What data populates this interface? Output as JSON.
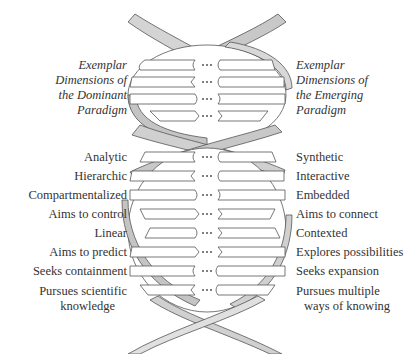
{
  "figure": {
    "title_cut": "",
    "dominant_header": [
      "Exemplar",
      "Dimensions of",
      "the Dominant",
      "Paradigm"
    ],
    "emerging_header": [
      "Exemplar",
      "Dimensions of",
      "the Emerging",
      "Paradigm"
    ],
    "rung_connector": "•••",
    "dominant_items": [
      "Analytic",
      "Hierarchic",
      "Compartmentalized",
      "Aims to control",
      "Linear",
      "Aims to predict",
      "Seeks containment",
      [
        "Pursues scientific",
        "knowledge"
      ]
    ],
    "emerging_items": [
      "Synthetic",
      "Interactive",
      "Embedded",
      "Aims to connect",
      "Contexted",
      "Explores possibilities",
      "Seeks expansion",
      [
        "Pursues multiple",
        "ways of knowing"
      ]
    ],
    "colors": {
      "strand_fill": "#d4d4d4",
      "strand_shade": "#b8b8b8",
      "outline": "#555555",
      "rung_fill": "#ffffff",
      "text": "#333333"
    }
  },
  "dominant": {
    "h0": "Exemplar",
    "h1": "Dimensions of",
    "h2": "the Dominant",
    "h3": "Paradigm",
    "i0": "Analytic",
    "i1": "Hierarchic",
    "i2": "Compartmentalized",
    "i3": "Aims to control",
    "i4": "Linear",
    "i5": "Aims to predict",
    "i6": "Seeks containment",
    "i7a": "Pursues scientific",
    "i7b": "knowledge"
  },
  "emerging": {
    "h0": "Exemplar",
    "h1": "Dimensions of",
    "h2": "the Emerging",
    "h3": "Paradigm",
    "i0": "Synthetic",
    "i1": "Interactive",
    "i2": "Embedded",
    "i3": "Aims to connect",
    "i4": "Contexted",
    "i5": "Explores possibilities",
    "i6": "Seeks expansion",
    "i7a": "Pursues multiple",
    "i7b": "ways of knowing"
  }
}
